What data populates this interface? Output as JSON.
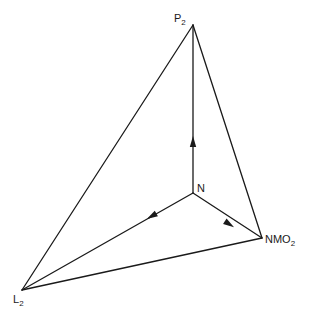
{
  "diagram": {
    "type": "ternary-tetrahedron-projection",
    "line_color": "#1a1a1a",
    "background": "#ffffff",
    "vertices": [
      {
        "id": "P2",
        "base": "P",
        "sub": "2",
        "x": 193,
        "y": 25
      },
      {
        "id": "N",
        "base": "N",
        "sub": "",
        "x": 193,
        "y": 193
      },
      {
        "id": "NMO2",
        "base": "NMO",
        "sub": "2",
        "x": 262,
        "y": 238
      },
      {
        "id": "L2",
        "base": "L",
        "sub": "2",
        "x": 22,
        "y": 290
      }
    ],
    "outer_edges": [
      [
        "P2",
        "L2"
      ],
      [
        "P2",
        "NMO2"
      ],
      [
        "L2",
        "NMO2"
      ]
    ],
    "directed_edges": [
      {
        "from": "N",
        "to": "P2",
        "arrow_at": [
          193,
          142
        ]
      },
      {
        "from": "N",
        "to": "L2",
        "arrow_at": [
          152,
          216
        ]
      },
      {
        "from": "N",
        "to": "NMO2",
        "arrow_at": [
          229,
          224
        ]
      }
    ],
    "labels": {
      "P2": {
        "base": "P",
        "sub": "2"
      },
      "N": {
        "base": "N",
        "sub": ""
      },
      "NMO2": {
        "base": "NMO",
        "sub": "2"
      },
      "L2": {
        "base": "L",
        "sub": "2"
      }
    }
  }
}
